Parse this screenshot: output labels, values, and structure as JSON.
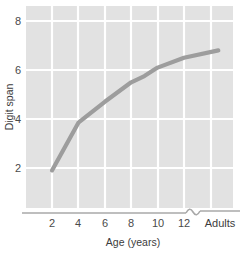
{
  "chart_data": {
    "type": "line",
    "title": "",
    "xlabel": "Age (years)",
    "ylabel": "Digit span",
    "x_tick_labels": [
      "2",
      "4",
      "6",
      "8",
      "10",
      "12",
      "Adults"
    ],
    "y_tick_labels": [
      "2",
      "4",
      "6",
      "8"
    ],
    "ylim": [
      0,
      8.6
    ],
    "xlim": [
      1,
      15.6
    ],
    "grid": true,
    "legend": null,
    "axis_break": {
      "present": true,
      "between": [
        "12",
        "Adults"
      ],
      "symbol": "squiggle"
    },
    "series": [
      {
        "name": "Digit span",
        "color": "#9d9d9d",
        "x": [
          2,
          4,
          6,
          8,
          9,
          10,
          12,
          14.6
        ],
        "x_labels": [
          "2",
          "4",
          "6",
          "8",
          "9",
          "10",
          "12",
          "Adults"
        ],
        "values": [
          1.9,
          3.85,
          4.7,
          5.5,
          5.75,
          6.1,
          6.5,
          6.8
        ]
      }
    ],
    "colors": {
      "plot_background": "#e2e2e2",
      "gridline": "#ffffff",
      "line": "#9d9d9d",
      "axis": "#a8a8a8",
      "tick_label": "#4a4a4a",
      "axis_title": "#3c3c3c",
      "page_background": "#ffffff"
    }
  },
  "labels": {
    "y_axis_title": "Digit span",
    "x_axis_title": "Age (years)",
    "y_tick_8": "8",
    "y_tick_6": "6",
    "y_tick_4": "4",
    "y_tick_2": "2",
    "x_tick_2": "2",
    "x_tick_4": "4",
    "x_tick_6": "6",
    "x_tick_8": "8",
    "x_tick_10": "10",
    "x_tick_12": "12",
    "x_tick_adults": "Adults"
  }
}
